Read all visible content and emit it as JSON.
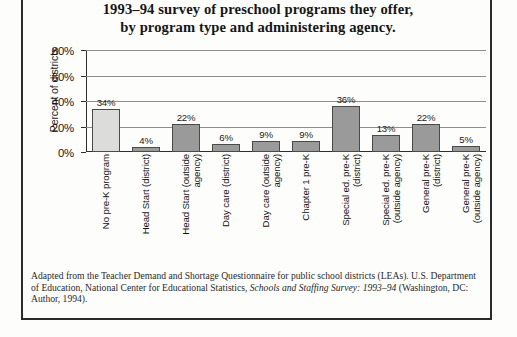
{
  "title": {
    "line1": "1993–94 survey of preschool programs they offer,",
    "line2": "by program type and administering agency."
  },
  "axis": {
    "y_title": "Percent of districts"
  },
  "footnote": {
    "part1": "Adapted from the Teacher Demand and Shortage Questionnaire for public school districts (LEAs). U.S. Department of Education, National Center for Educational Statistics, ",
    "italic1": "Schools and Staffing Survey: 1993–94",
    "part2": " (Washington, DC: Author, 1994)."
  },
  "colors": {
    "bar_fill": "#9a9a9a",
    "bar_first_fill": "#dcdcda",
    "bar_border": "#4a4a4a",
    "axis": "#2e2e2e",
    "grid": "#8e8e8e",
    "text": "#1a1a1a",
    "page_border": "#2b2b2b"
  },
  "chart_data": {
    "type": "bar",
    "title": "1993–94 survey of preschool programs they offer, by program type and administering agency.",
    "xlabel": "",
    "ylabel": "Percent of districts",
    "ylim": [
      0,
      80
    ],
    "yticks": [
      0,
      20,
      40,
      60,
      80
    ],
    "ytick_labels": [
      "0%",
      "20%",
      "40%",
      "60%",
      "80%"
    ],
    "grid": true,
    "legend": false,
    "categories": [
      "No pre-K program",
      "Head Start (district)",
      "Head Start (outside agency)",
      "Day care (district)",
      "Day care (outside agency)",
      "Chapter 1 pre-K",
      "Special ed. pre-K (district)",
      "Special ed. pre-K (outside agency)",
      "General pre-K (district)",
      "General pre-K (outside agency)"
    ],
    "category_lines": [
      "No pre-K program",
      "Head Start (district)",
      "Head Start (outside\nagency)",
      "Day care (district)",
      "Day care (outside\nagency)",
      "Chapter 1 pre-K",
      "Special ed. pre-K\n(district)",
      "Special ed. pre-K\n(outside agency)",
      "General pre-K\n(district)",
      "General pre-K\n(outside agency)"
    ],
    "values": [
      34,
      4,
      22,
      6,
      9,
      9,
      36,
      13,
      22,
      5
    ],
    "value_labels": [
      "34%",
      "4%",
      "22%",
      "6%",
      "9%",
      "9%",
      "36%",
      "13%",
      "22%",
      "5%"
    ]
  }
}
